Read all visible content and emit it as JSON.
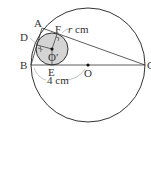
{
  "diagram": {
    "points": {
      "A": "A",
      "B": "B",
      "C": "C",
      "D": "D",
      "E": "E",
      "F": "F",
      "O": "O",
      "O_prime": "O′"
    },
    "labels": {
      "radius_unit": "cm",
      "radius_var": "r",
      "radius_small": "r",
      "length_BO": "4 cm"
    },
    "colors": {
      "stroke": "#333333",
      "small_circle_fill": "#d4d4d4",
      "guide": "#999999"
    }
  }
}
